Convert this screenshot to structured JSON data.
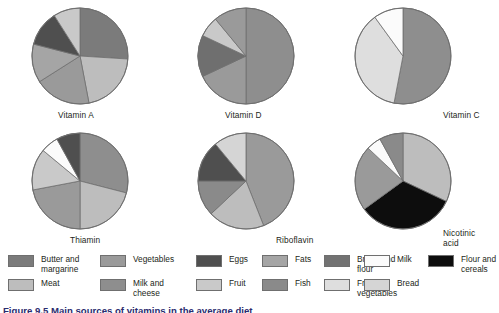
{
  "figure": {
    "caption": "Figure 9.5 Main sources of vitamins in the average diet",
    "background": "#ffffff"
  },
  "palette": {
    "butter_and_margarine": "#7b7b7b",
    "meat": "#bdbdbd",
    "vegetables": "#9a9a9a",
    "milk_and_cheese": "#8e8e8e",
    "eggs": "#4f4f4f",
    "fruit": "#c9c9c9",
    "fats": "#a5a5a5",
    "fish": "#8a8a8a",
    "bread_and_flour": "#727272",
    "fruit_and_vegetables": "#dedede",
    "milk": "#fbfbfb",
    "bread": "#d5d5d5",
    "flour_and_cereals": "#0d0d0d",
    "outline": "#6f6f6f"
  },
  "legend": {
    "columns": [
      {
        "items": [
          {
            "label": "Butter and\nmargarine",
            "color": "#7b7b7b",
            "key": "butter-and-margarine"
          },
          {
            "label": "Meat",
            "color": "#bdbdbd",
            "key": "meat"
          }
        ]
      },
      {
        "items": [
          {
            "label": "Vegetables",
            "color": "#9a9a9a",
            "key": "vegetables"
          },
          {
            "label": "Milk and\ncheese",
            "color": "#8e8e8e",
            "key": "milk-and-cheese"
          }
        ]
      },
      {
        "items": [
          {
            "label": "Eggs",
            "color": "#4f4f4f",
            "key": "eggs"
          },
          {
            "label": "Fruit",
            "color": "#c9c9c9",
            "key": "fruit"
          }
        ]
      },
      {
        "items": [
          {
            "label": "Fats",
            "color": "#a5a5a5",
            "key": "fats"
          },
          {
            "label": "Fish",
            "color": "#8a8a8a",
            "key": "fish"
          }
        ]
      },
      {
        "items": [
          {
            "label": "Bread and\nflour",
            "color": "#727272",
            "key": "bread-and-flour"
          },
          {
            "label": "Fruit and\nvegetables",
            "color": "#dedede",
            "key": "fruit-and-vegetables"
          }
        ]
      },
      {
        "items": [
          {
            "label": "Milk",
            "color": "#fbfbfb",
            "key": "milk"
          },
          {
            "label": "Bread",
            "color": "#d5d5d5",
            "key": "bread"
          }
        ]
      },
      {
        "items": [
          {
            "label": "Flour and\ncereals",
            "color": "#0d0d0d",
            "key": "flour-and-cereals"
          }
        ]
      }
    ]
  },
  "chart_data": [
    {
      "type": "pie",
      "title": "Vitamin A",
      "labels": [
        "Butter and margarine",
        "Meat",
        "Vegetables",
        "Milk and cheese",
        "Eggs",
        "Fats"
      ],
      "values": [
        26,
        21,
        19,
        13,
        12,
        9
      ],
      "colors": [
        "#7b7b7b",
        "#bdbdbd",
        "#9a9a9a",
        "#a5a5a5",
        "#4f4f4f",
        "#c9c9c9"
      ],
      "start_angle": 0,
      "direction": "clockwise"
    },
    {
      "type": "pie",
      "title": "Vitamin D",
      "labels": [
        "Butter and margarine",
        "Milk and cheese",
        "Eggs",
        "Fats",
        "Fish"
      ],
      "values": [
        50,
        18,
        14,
        7,
        11
      ],
      "colors": [
        "#8e8e8e",
        "#9a9a9a",
        "#6f6f6f",
        "#c9c9c9",
        "#9a9a9a"
      ],
      "start_angle": 0,
      "direction": "clockwise"
    },
    {
      "type": "pie",
      "title": "Vitamin C",
      "labels": [
        "Vegetables",
        "Fruit and vegetables",
        "Milk"
      ],
      "values": [
        53,
        37,
        10
      ],
      "colors": [
        "#8e8e8e",
        "#dedede",
        "#fbfbfb"
      ],
      "start_angle": 0,
      "direction": "clockwise"
    },
    {
      "type": "pie",
      "title": "Thiamin",
      "labels": [
        "Bread and flour",
        "Meat",
        "Vegetables",
        "Milk and cheese",
        "Milk",
        "Eggs"
      ],
      "values": [
        29,
        21,
        22,
        14,
        6,
        8
      ],
      "colors": [
        "#8e8e8e",
        "#bdbdbd",
        "#9a9a9a",
        "#c9c9c9",
        "#fbfbfb",
        "#4f4f4f"
      ],
      "start_angle": 0,
      "direction": "clockwise"
    },
    {
      "type": "pie",
      "title": "Riboflavin",
      "labels": [
        "Milk and cheese",
        "Meat",
        "Vegetables",
        "Bread and flour",
        "Eggs"
      ],
      "values": [
        44,
        19,
        12,
        14,
        11
      ],
      "colors": [
        "#9a9a9a",
        "#bdbdbd",
        "#8a8a8a",
        "#4f4f4f",
        "#d5d5d5"
      ],
      "start_angle": 0,
      "direction": "clockwise"
    },
    {
      "type": "pie",
      "title": "Nicotinic\nacid",
      "labels": [
        "Meat",
        "Flour and cereals",
        "Vegetables",
        "Milk",
        "Milk and cheese"
      ],
      "values": [
        32,
        33,
        22,
        5,
        8
      ],
      "colors": [
        "#bdbdbd",
        "#0d0d0d",
        "#9a9a9a",
        "#fbfbfb",
        "#8a8a8a"
      ],
      "start_angle": 0,
      "direction": "clockwise"
    }
  ]
}
